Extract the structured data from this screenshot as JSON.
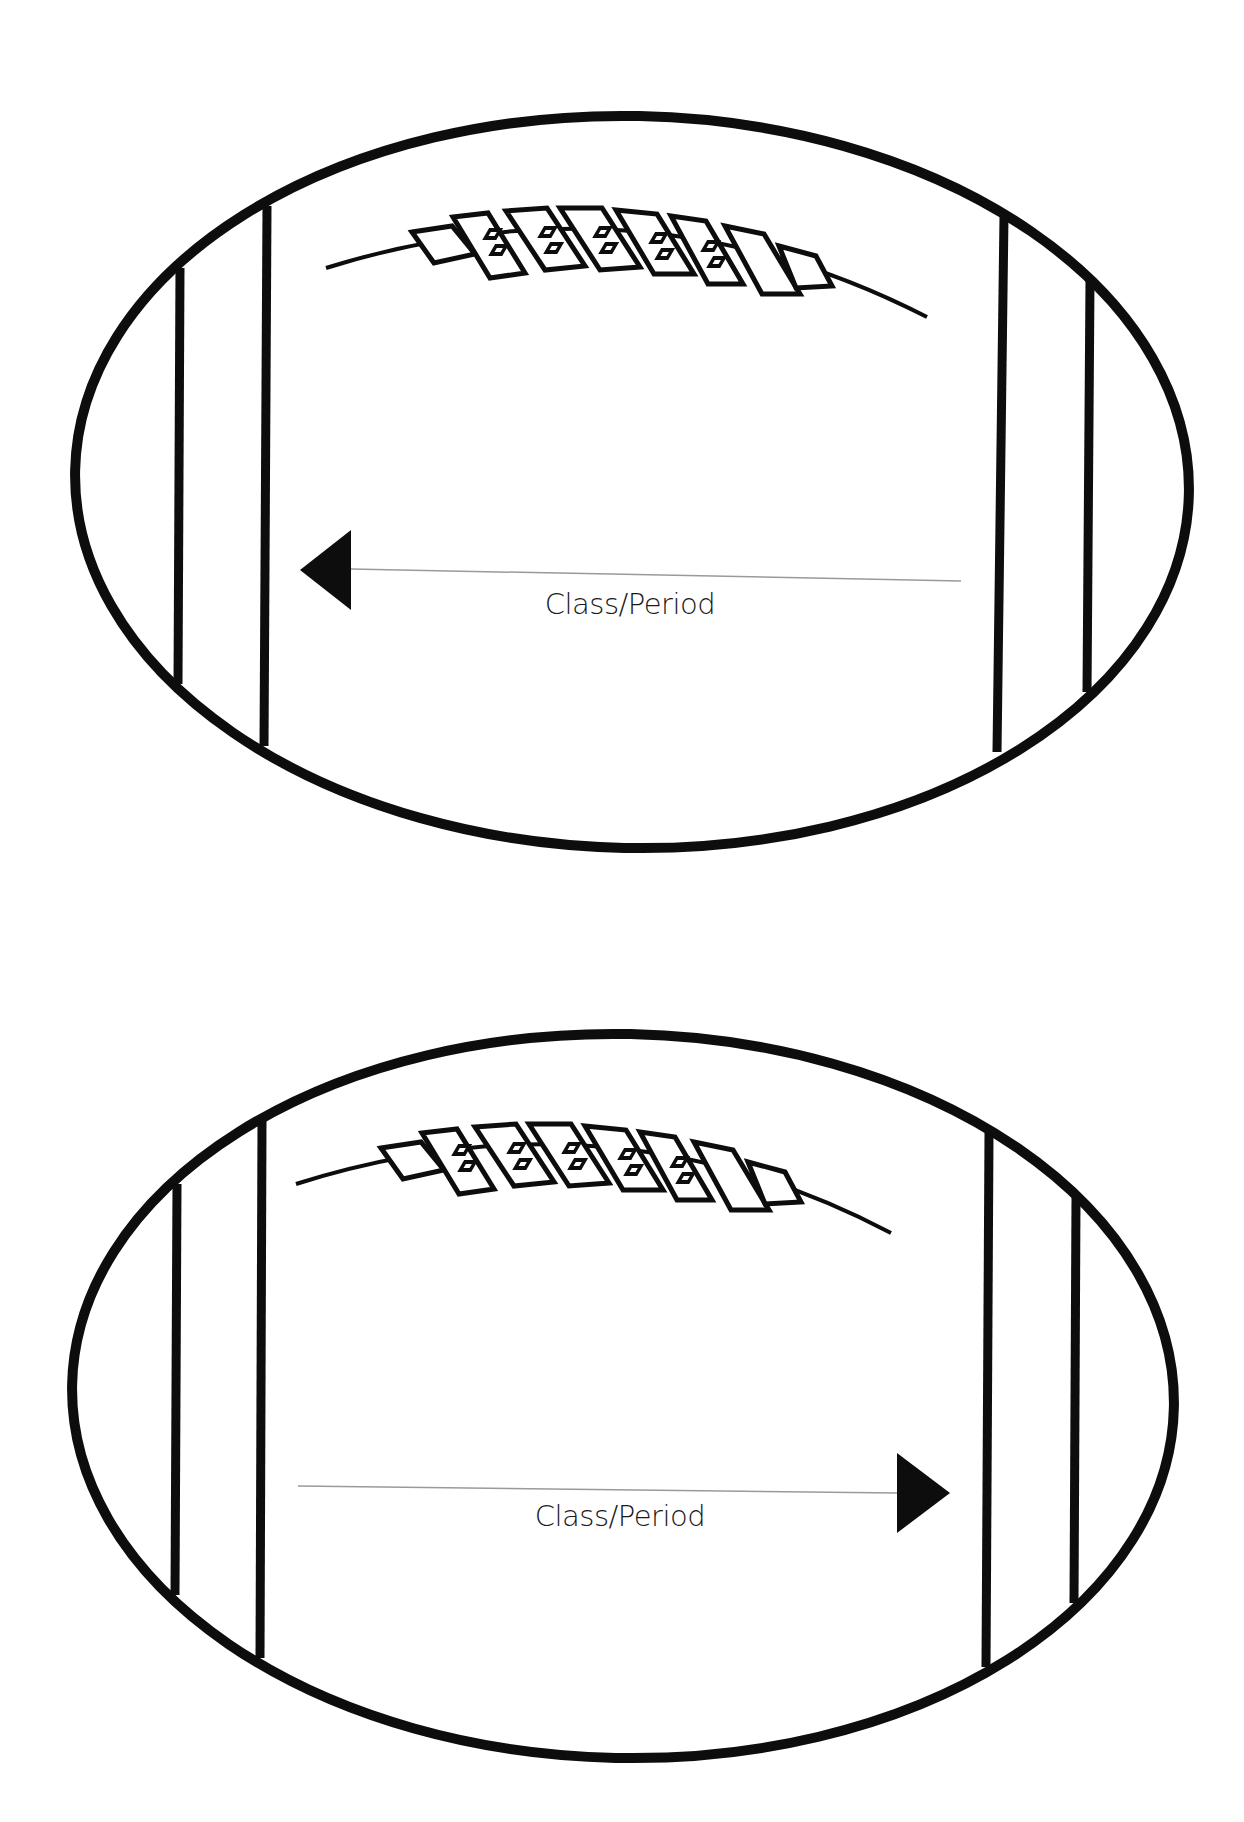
{
  "page": {
    "background": "#ffffff",
    "ink_color": "#0d0d0d",
    "guide_line_color": "#9a9a9a"
  },
  "footballs": [
    {
      "id": "top",
      "ellipse": {
        "cx": 632,
        "cy": 482,
        "rx": 557,
        "ry": 366,
        "rotate": 1.2
      },
      "stripes": [
        {
          "x1": 180,
          "y1": 268,
          "x2": 178,
          "y2": 684
        },
        {
          "x1": 267,
          "y1": 206,
          "x2": 264,
          "y2": 746
        },
        {
          "x1": 1004,
          "y1": 216,
          "x2": 997,
          "y2": 752
        },
        {
          "x1": 1090,
          "y1": 281,
          "x2": 1087,
          "y2": 692
        }
      ],
      "seam": {
        "path": "M 326 268 Q 640 170 927 317"
      },
      "laces_origin": {
        "x": 412,
        "y": 232
      },
      "arrow": {
        "direction": "left",
        "tip": [
          300,
          570
        ],
        "base_x": 351,
        "half_height": 40
      },
      "guide_line": {
        "x1": 351,
        "y1": 569,
        "x2": 961,
        "y2": 581
      },
      "label": {
        "text": "Class/Period",
        "x": 630,
        "y": 614
      }
    },
    {
      "id": "bottom",
      "ellipse": {
        "cx": 623,
        "cy": 1396,
        "rx": 551,
        "ry": 362,
        "rotate": 1.2
      },
      "stripes": [
        {
          "x1": 177,
          "y1": 1184,
          "x2": 175,
          "y2": 1595
        },
        {
          "x1": 262,
          "y1": 1121,
          "x2": 260,
          "y2": 1658
        },
        {
          "x1": 989,
          "y1": 1133,
          "x2": 986,
          "y2": 1667
        },
        {
          "x1": 1076,
          "y1": 1198,
          "x2": 1074,
          "y2": 1603
        }
      ],
      "seam": {
        "path": "M 296 1184 Q 610 1085 891 1233"
      },
      "laces_origin": {
        "x": 381,
        "y": 1148
      },
      "arrow": {
        "direction": "right",
        "tip": [
          950,
          1493
        ],
        "base_x": 897,
        "half_height": 40
      },
      "guide_line": {
        "x1": 298,
        "y1": 1486,
        "x2": 897,
        "y2": 1493
      },
      "label": {
        "text": "Class/Period",
        "x": 620,
        "y": 1526
      }
    }
  ],
  "labels": {
    "top_label": "Class/Period",
    "bottom_label": "Class/Period"
  }
}
